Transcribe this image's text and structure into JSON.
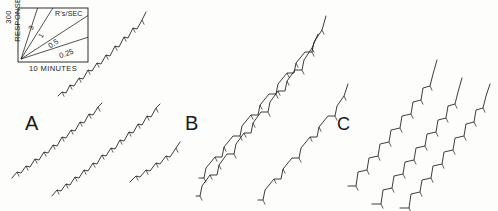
{
  "figure": {
    "type": "cumulative-record",
    "background": "#fdfdfc",
    "ink": "#1a1a1a",
    "width": 498,
    "height": 211
  },
  "legend": {
    "name": "rate-calibration-box",
    "y_axis_label": "300 RESPONSES",
    "x_axis_label": "10 MINUTES",
    "units_title": "R's/SEC",
    "box": {
      "x": 18,
      "y": 8,
      "w": 70,
      "h": 54
    },
    "rate_lines": [
      {
        "label": "3",
        "value": 3,
        "angle_deg": 72
      },
      {
        "label": "1",
        "value": 1,
        "angle_deg": 58
      },
      {
        "label": "0.5",
        "value": 0.5,
        "angle_deg": 33
      },
      {
        "label": "0.25",
        "value": 0.25,
        "angle_deg": 18
      }
    ]
  },
  "panels": [
    {
      "id": "A",
      "label": "A",
      "pattern": "scalloped",
      "x": 25,
      "y": 112
    },
    {
      "id": "B",
      "label": "B",
      "pattern": "break-and-run",
      "x": 185,
      "y": 112
    },
    {
      "id": "C",
      "label": "C",
      "pattern": "stepped-pause",
      "x": 337,
      "y": 114
    }
  ],
  "chart_data": {
    "type": "line",
    "title": "",
    "xlabel": "10 MINUTES",
    "ylabel": "300 RESPONSES",
    "grid": false,
    "legend_position": "top-left",
    "legend_entries": [
      "3",
      "1",
      "0.5",
      "0.25"
    ],
    "annotations": [
      "A",
      "B",
      "C",
      "R's/SEC",
      "300 RESPONSES",
      "10 MINUTES"
    ],
    "series": [
      {
        "name": "A-record-1",
        "panel": "A",
        "tick_marks": true,
        "points": [
          [
            58,
            96
          ],
          [
            62,
            92
          ],
          [
            66,
            93
          ],
          [
            70,
            85
          ],
          [
            74,
            86
          ],
          [
            79,
            78
          ],
          [
            83,
            79
          ],
          [
            88,
            70
          ],
          [
            92,
            71
          ],
          [
            97,
            63
          ],
          [
            101,
            64
          ],
          [
            106,
            55
          ],
          [
            110,
            56
          ],
          [
            115,
            46
          ],
          [
            119,
            47
          ],
          [
            124,
            37
          ],
          [
            128,
            38
          ],
          [
            133,
            28
          ],
          [
            137,
            29
          ],
          [
            142,
            20
          ],
          [
            146,
            12
          ]
        ]
      },
      {
        "name": "A-record-2",
        "panel": "A",
        "tick_marks": true,
        "points": [
          [
            12,
            178
          ],
          [
            17,
            172
          ],
          [
            21,
            173
          ],
          [
            26,
            166
          ],
          [
            30,
            167
          ],
          [
            35,
            159
          ],
          [
            39,
            160
          ],
          [
            44,
            152
          ],
          [
            48,
            153
          ],
          [
            53,
            145
          ],
          [
            57,
            146
          ],
          [
            62,
            137
          ],
          [
            66,
            138
          ],
          [
            71,
            130
          ],
          [
            75,
            131
          ],
          [
            80,
            122
          ],
          [
            84,
            123
          ],
          [
            89,
            114
          ],
          [
            93,
            115
          ],
          [
            98,
            107
          ],
          [
            102,
            103
          ]
        ]
      },
      {
        "name": "A-record-3",
        "panel": "A",
        "tick_marks": true,
        "points": [
          [
            52,
            196
          ],
          [
            57,
            190
          ],
          [
            61,
            191
          ],
          [
            66,
            184
          ],
          [
            70,
            185
          ],
          [
            75,
            177
          ],
          [
            79,
            178
          ],
          [
            84,
            170
          ],
          [
            88,
            171
          ],
          [
            93,
            163
          ],
          [
            97,
            164
          ],
          [
            102,
            155
          ],
          [
            106,
            156
          ],
          [
            111,
            148
          ],
          [
            115,
            149
          ],
          [
            120,
            140
          ],
          [
            124,
            141
          ],
          [
            129,
            132
          ],
          [
            133,
            133
          ],
          [
            138,
            124
          ],
          [
            142,
            125
          ],
          [
            147,
            116
          ],
          [
            151,
            117
          ],
          [
            156,
            108
          ],
          [
            160,
            104
          ]
        ]
      },
      {
        "name": "A-record-4",
        "panel": "A",
        "tick_marks": true,
        "points": [
          [
            130,
            182
          ],
          [
            136,
            176
          ],
          [
            140,
            177
          ],
          [
            146,
            170
          ],
          [
            150,
            171
          ],
          [
            156,
            163
          ],
          [
            160,
            164
          ],
          [
            166,
            156
          ],
          [
            170,
            157
          ],
          [
            176,
            148
          ],
          [
            180,
            142
          ]
        ]
      },
      {
        "name": "B-record-1",
        "panel": "B",
        "tick_marks": true,
        "points": [
          [
            199,
            178
          ],
          [
            204,
            178
          ],
          [
            206,
            168
          ],
          [
            215,
            157
          ],
          [
            222,
            157
          ],
          [
            224,
            147
          ],
          [
            233,
            136
          ],
          [
            240,
            136
          ],
          [
            242,
            126
          ],
          [
            251,
            115
          ],
          [
            258,
            115
          ],
          [
            260,
            105
          ],
          [
            269,
            94
          ],
          [
            276,
            94
          ],
          [
            278,
            84
          ],
          [
            287,
            73
          ],
          [
            294,
            73
          ],
          [
            296,
            63
          ],
          [
            305,
            52
          ],
          [
            312,
            52
          ],
          [
            314,
            42
          ],
          [
            322,
            30
          ],
          [
            326,
            16
          ]
        ]
      },
      {
        "name": "B-record-2",
        "panel": "B",
        "tick_marks": true,
        "points": [
          [
            196,
            196
          ],
          [
            200,
            196
          ],
          [
            202,
            186
          ],
          [
            210,
            175
          ],
          [
            217,
            175
          ],
          [
            219,
            165
          ],
          [
            227,
            154
          ],
          [
            234,
            154
          ],
          [
            236,
            144
          ],
          [
            244,
            133
          ],
          [
            251,
            133
          ],
          [
            253,
            123
          ],
          [
            261,
            112
          ],
          [
            268,
            112
          ],
          [
            270,
            102
          ],
          [
            278,
            91
          ],
          [
            285,
            91
          ],
          [
            287,
            81
          ],
          [
            295,
            70
          ],
          [
            302,
            70
          ],
          [
            304,
            60
          ],
          [
            312,
            48
          ],
          [
            318,
            34
          ]
        ]
      },
      {
        "name": "B-record-3",
        "panel": "B",
        "tick_marks": true,
        "points": [
          [
            258,
            200
          ],
          [
            263,
            200
          ],
          [
            265,
            190
          ],
          [
            274,
            179
          ],
          [
            281,
            179
          ],
          [
            283,
            169
          ],
          [
            292,
            158
          ],
          [
            299,
            158
          ],
          [
            301,
            148
          ],
          [
            310,
            137
          ],
          [
            317,
            137
          ],
          [
            319,
            127
          ],
          [
            328,
            116
          ],
          [
            335,
            116
          ],
          [
            337,
            106
          ],
          [
            344,
            96
          ],
          [
            348,
            84
          ]
        ]
      },
      {
        "name": "C-record-1",
        "panel": "C",
        "tick_marks": true,
        "points": [
          [
            348,
            186
          ],
          [
            356,
            186
          ],
          [
            358,
            172
          ],
          [
            367,
            170
          ],
          [
            369,
            158
          ],
          [
            378,
            156
          ],
          [
            380,
            144
          ],
          [
            389,
            142
          ],
          [
            391,
            130
          ],
          [
            400,
            128
          ],
          [
            402,
            116
          ],
          [
            411,
            114
          ],
          [
            413,
            102
          ],
          [
            421,
            100
          ],
          [
            423,
            88
          ],
          [
            430,
            86
          ],
          [
            433,
            74
          ],
          [
            437,
            60
          ]
        ]
      },
      {
        "name": "C-record-2",
        "panel": "C",
        "tick_marks": true,
        "points": [
          [
            372,
            204
          ],
          [
            381,
            204
          ],
          [
            383,
            190
          ],
          [
            392,
            188
          ],
          [
            394,
            176
          ],
          [
            403,
            174
          ],
          [
            405,
            162
          ],
          [
            414,
            160
          ],
          [
            416,
            148
          ],
          [
            425,
            146
          ],
          [
            427,
            134
          ],
          [
            436,
            132
          ],
          [
            438,
            120
          ],
          [
            446,
            118
          ],
          [
            448,
            106
          ],
          [
            455,
            104
          ],
          [
            458,
            92
          ],
          [
            462,
            78
          ]
        ]
      },
      {
        "name": "C-record-3",
        "panel": "C",
        "tick_marks": true,
        "points": [
          [
            400,
            208
          ],
          [
            409,
            208
          ],
          [
            411,
            194
          ],
          [
            420,
            192
          ],
          [
            422,
            180
          ],
          [
            431,
            178
          ],
          [
            433,
            166
          ],
          [
            442,
            164
          ],
          [
            444,
            152
          ],
          [
            453,
            150
          ],
          [
            455,
            138
          ],
          [
            464,
            136
          ],
          [
            466,
            124
          ],
          [
            474,
            122
          ],
          [
            476,
            110
          ],
          [
            483,
            108
          ],
          [
            486,
            96
          ],
          [
            490,
            84
          ]
        ]
      }
    ]
  }
}
